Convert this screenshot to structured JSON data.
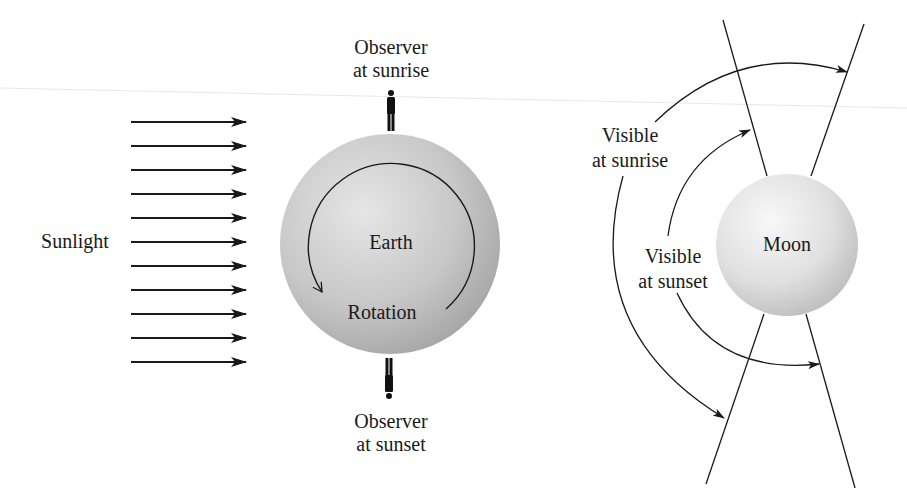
{
  "diagram": {
    "colors": {
      "ink": "#1a1a1a",
      "earth_light": "#e4e4e4",
      "earth_dark": "#a9a9a9",
      "moon_light": "#f6f6f6",
      "moon_dark": "#c2c2c2",
      "background": "#ffffff"
    },
    "sunlight": {
      "label": "Sunlight",
      "arrow_count": 11,
      "direction": "right"
    },
    "earth": {
      "label": "Earth",
      "rotation_label": "Rotation",
      "rotation_direction": "counterclockwise-arrow-icon"
    },
    "observers": {
      "sunrise": {
        "line1": "Observer",
        "line2": "at sunrise",
        "icon": "person-standing-icon"
      },
      "sunset": {
        "line1": "Observer",
        "line2": "at sunset",
        "icon": "person-inverted-icon"
      }
    },
    "moon": {
      "label": "Moon",
      "visible_sunrise": {
        "line1": "Visible",
        "line2": "at sunrise"
      },
      "visible_sunset": {
        "line1": "Visible",
        "line2": "at sunset"
      }
    }
  }
}
